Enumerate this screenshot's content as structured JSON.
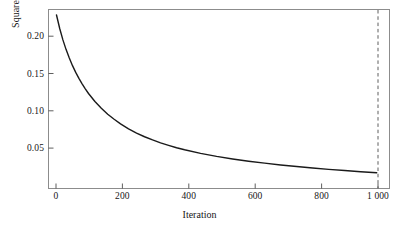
{
  "chart_data": {
    "type": "line",
    "title": "",
    "xlabel": "Iteration",
    "ylabel": "Squared error loss",
    "xlim": [
      -25,
      1040
    ],
    "ylim": [
      0.0115,
      0.2235
    ],
    "grid": false,
    "legend": null,
    "xticks": [
      0,
      200,
      400,
      600,
      800,
      1000
    ],
    "xtick_labels": [
      "0",
      "200",
      "400",
      "600",
      "800",
      "1 000"
    ],
    "yticks": [
      0.05,
      0.1,
      0.15,
      0.2
    ],
    "ytick_labels": [
      "0.05",
      "0.10",
      "0.15",
      "0.20"
    ],
    "series": [
      {
        "name": "Squared error loss",
        "color": "#1a1a1a",
        "style": "solid",
        "x": [
          0,
          10,
          20,
          30,
          40,
          50,
          60,
          70,
          80,
          90,
          100,
          120,
          140,
          160,
          180,
          200,
          225,
          250,
          275,
          300,
          325,
          350,
          375,
          400,
          450,
          500,
          550,
          600,
          650,
          700,
          750,
          800,
          850,
          900,
          950,
          1000
        ],
        "y": [
          0.217,
          0.201,
          0.1875,
          0.176,
          0.166,
          0.157,
          0.149,
          0.142,
          0.1355,
          0.1295,
          0.124,
          0.1145,
          0.1065,
          0.0995,
          0.0935,
          0.088,
          0.0822,
          0.0772,
          0.0728,
          0.069,
          0.0656,
          0.0626,
          0.0598,
          0.0574,
          0.0531,
          0.0495,
          0.0465,
          0.0438,
          0.0415,
          0.0394,
          0.0375,
          0.0358,
          0.0342,
          0.0328,
          0.0314,
          0.0302
        ]
      }
    ],
    "annotations": [
      {
        "type": "vline",
        "name": "iteration-1000-marker",
        "x": 1000,
        "style": "dashed",
        "color": "#4d4d4d"
      }
    ]
  }
}
